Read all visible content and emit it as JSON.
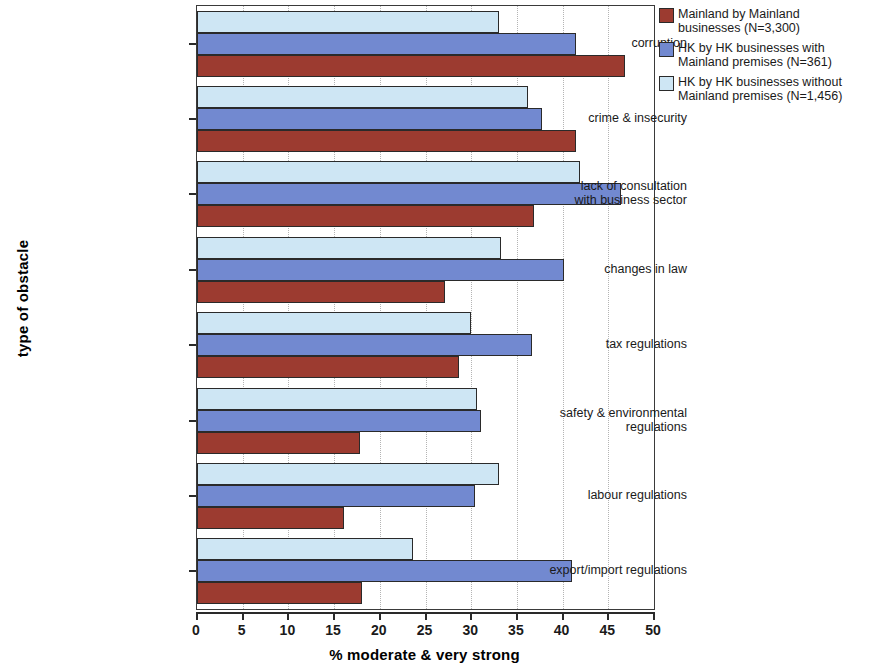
{
  "chart_data": {
    "type": "bar",
    "orientation": "horizontal",
    "title": "",
    "xlabel": "% moderate & very strong",
    "ylabel": "type of obstacle",
    "xlim": [
      0,
      50
    ],
    "xticks": [
      0,
      5,
      10,
      15,
      20,
      25,
      30,
      35,
      40,
      45,
      50
    ],
    "grid": "vertical dotted",
    "legend_position": "right-top",
    "categories": [
      "corruption",
      "crime & insecurity",
      "lack of consultation\nwith business sector",
      "changes in law",
      "tax regulations",
      "safety & environmental\nregulations",
      "labour regulations",
      "export/import regulations"
    ],
    "series": [
      {
        "name": "Mainland by Mainland businesses (N=3,300)",
        "legend_label": "Mainland by Mainland\nbusinesses (N=3,300)",
        "color": "#9c3b30",
        "values": [
          46.8,
          41.5,
          36.9,
          27.1,
          28.7,
          17.8,
          16.1,
          18.0
        ]
      },
      {
        "name": "HK by HK businesses with Mainland premises (N=361)",
        "legend_label": "HK by HK businesses with\nMainland premises (N=361)",
        "color": "#7289d0",
        "values": [
          41.5,
          37.7,
          46.4,
          40.2,
          36.7,
          31.1,
          30.4,
          41.0
        ]
      },
      {
        "name": "HK by HK businesses without Mainland premises (N=1,456)",
        "legend_label": "HK by HK businesses without\nMainland premises (N=1,456)",
        "color": "#cee6f4",
        "values": [
          33.0,
          36.2,
          41.9,
          33.3,
          30.0,
          30.6,
          33.0,
          23.6
        ]
      }
    ]
  }
}
